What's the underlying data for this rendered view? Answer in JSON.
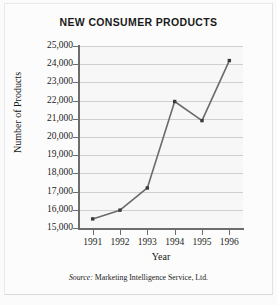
{
  "figure": {
    "title": "NEW CONSUMER PRODUCTS",
    "source_keyword": "Source:",
    "source_text": "Marketing Intelligence Service, Ltd.",
    "colors": {
      "line": "#6b6b6b",
      "marker": "#3b3b3b",
      "grid": "#cfcfcf",
      "axis": "#6d6d6d",
      "plot_background": "#f7f7f7",
      "page_background": "#fcfcfc",
      "text": "#1a1a1a"
    }
  },
  "chart_data": {
    "type": "line",
    "title": "NEW CONSUMER PRODUCTS",
    "xlabel": "Year",
    "ylabel": "Number of Products",
    "categories": [
      "1991",
      "1992",
      "1993",
      "1994",
      "1995",
      "1996"
    ],
    "values": [
      15500,
      15980,
      17200,
      21950,
      20900,
      24200
    ],
    "x": [
      1991,
      1992,
      1993,
      1994,
      1995,
      1996
    ],
    "ylim": [
      15000,
      25000
    ],
    "ytick_values": [
      15000,
      16000,
      17000,
      18000,
      19000,
      20000,
      21000,
      22000,
      23000,
      24000,
      25000
    ],
    "ytick_labels": [
      "15,000",
      "16,000",
      "17,000",
      "18,000",
      "19,000",
      "20,000",
      "21,000",
      "22,000",
      "23,000",
      "24,000",
      "25,000"
    ],
    "xtick_labels": [
      "1991",
      "1992",
      "1993",
      "1994",
      "1995",
      "1996"
    ],
    "grid": true,
    "grid_axis": "y",
    "legend": null,
    "markers": "square",
    "annotations": [
      "Source: Marketing Intelligence Service, Ltd."
    ]
  }
}
